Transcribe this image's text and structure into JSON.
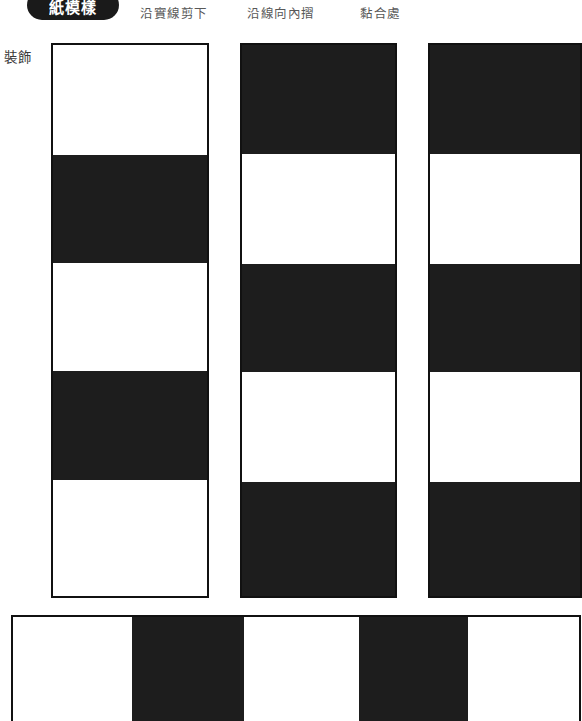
{
  "header": {
    "logo_text": "紙模樣",
    "legend": [
      {
        "id": "cut",
        "label": "沿實線剪下"
      },
      {
        "id": "fold",
        "label": "沿線向內摺"
      },
      {
        "id": "glue",
        "label": "黏合處"
      }
    ]
  },
  "labels": {
    "decoration": "裝飾"
  },
  "colors": {
    "ink": "#1d1d1d",
    "outline": "#111111",
    "paper": "#ffffff",
    "legend_text": "#585858"
  },
  "template": {
    "panels": [
      {
        "name": "panel-1",
        "x": 51,
        "y": 43,
        "width": 158,
        "height": 555,
        "bands": [
          {
            "fill": "light",
            "top": 0,
            "height": 110
          },
          {
            "fill": "dark",
            "top": 110,
            "height": 108
          },
          {
            "fill": "light",
            "top": 218,
            "height": 108
          },
          {
            "fill": "dark",
            "top": 326,
            "height": 109
          },
          {
            "fill": "light",
            "top": 435,
            "height": 116
          }
        ]
      },
      {
        "name": "panel-2",
        "x": 240,
        "y": 43,
        "width": 157,
        "height": 555,
        "bands": [
          {
            "fill": "dark",
            "top": 0,
            "height": 109
          },
          {
            "fill": "light",
            "top": 109,
            "height": 110
          },
          {
            "fill": "dark",
            "top": 219,
            "height": 108
          },
          {
            "fill": "light",
            "top": 327,
            "height": 110
          },
          {
            "fill": "dark",
            "top": 437,
            "height": 114
          }
        ]
      },
      {
        "name": "panel-3",
        "x": 428,
        "y": 43,
        "width": 154,
        "height": 555,
        "bands": [
          {
            "fill": "dark",
            "top": 0,
            "height": 109
          },
          {
            "fill": "light",
            "top": 109,
            "height": 110
          },
          {
            "fill": "dark",
            "top": 219,
            "height": 108
          },
          {
            "fill": "light",
            "top": 327,
            "height": 110
          },
          {
            "fill": "dark",
            "top": 437,
            "height": 114
          }
        ]
      }
    ],
    "bottom_strip": {
      "name": "bottom-strip",
      "x": 11,
      "y": 615,
      "width": 570,
      "height": 106,
      "stripes": [
        {
          "fill": "light",
          "left": 0,
          "width": 119
        },
        {
          "fill": "dark",
          "left": 119,
          "width": 112
        },
        {
          "fill": "light",
          "left": 231,
          "width": 115
        },
        {
          "fill": "dark",
          "left": 346,
          "width": 109
        },
        {
          "fill": "light",
          "left": 455,
          "width": 115
        }
      ]
    }
  }
}
